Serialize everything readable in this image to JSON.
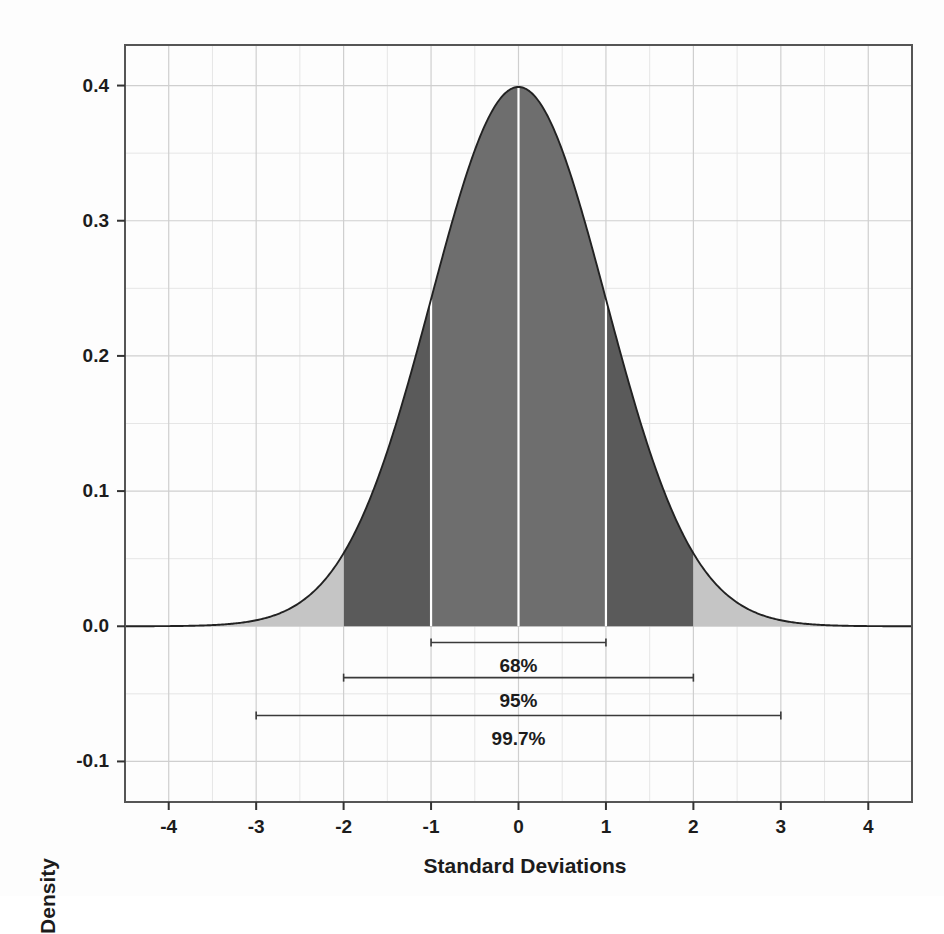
{
  "chart_data": {
    "type": "area",
    "title": "",
    "xlabel": "Standard Deviations",
    "ylabel": "Density",
    "xlim": [
      -4.5,
      4.5
    ],
    "ylim": [
      -0.13,
      0.43
    ],
    "grid": true,
    "legend_position": "none",
    "x_ticks": [
      "-4",
      "-3",
      "-2",
      "-1",
      "0",
      "1",
      "2",
      "3",
      "4"
    ],
    "x_tick_values": [
      -4,
      -3,
      -2,
      -1,
      0,
      1,
      2,
      3,
      4
    ],
    "y_ticks": [
      "0.4",
      "0.3",
      "0.2",
      "0.1",
      "0.0",
      "-0.1"
    ],
    "y_tick_values": [
      0.4,
      0.3,
      0.2,
      0.1,
      0.0,
      -0.1
    ],
    "distribution": "standard normal",
    "peak_value": 0.399,
    "peak_x": 0,
    "series": [
      {
        "name": "Standard normal density",
        "x": [
          -4.5,
          -4.25,
          -4,
          -3.75,
          -3.5,
          -3.25,
          -3,
          -2.75,
          -2.5,
          -2.25,
          -2,
          -1.75,
          -1.5,
          -1.25,
          -1,
          -0.75,
          -0.5,
          -0.25,
          0,
          0.25,
          0.5,
          0.75,
          1,
          1.25,
          1.5,
          1.75,
          2,
          2.25,
          2.5,
          2.75,
          3,
          3.25,
          3.5,
          3.75,
          4,
          4.25,
          4.5
        ],
        "values": [
          0.0,
          0.0001,
          0.0001,
          0.0004,
          0.0009,
          0.002,
          0.0044,
          0.0091,
          0.0175,
          0.0317,
          0.054,
          0.0863,
          0.1295,
          0.1826,
          0.242,
          0.3011,
          0.3521,
          0.3867,
          0.3989,
          0.3867,
          0.3521,
          0.3011,
          0.242,
          0.1826,
          0.1295,
          0.0863,
          0.054,
          0.0317,
          0.0175,
          0.0091,
          0.0044,
          0.002,
          0.0009,
          0.0004,
          0.0001,
          0.0001,
          0.0
        ]
      }
    ],
    "shaded_regions": [
      {
        "name": "within-1-sd",
        "from": -1,
        "to": 1,
        "color": "#6e6e6e",
        "label": "68%"
      },
      {
        "name": "one-to-two-sd-left",
        "from": -2,
        "to": -1,
        "color": "#5a5a5a",
        "label": "95%"
      },
      {
        "name": "one-to-two-sd-right",
        "from": 1,
        "to": 2,
        "color": "#5a5a5a",
        "label": "95%"
      },
      {
        "name": "beyond-two-sd-left",
        "from": -4.5,
        "to": -2,
        "color": "#c5c5c5",
        "label": "99.7%"
      },
      {
        "name": "beyond-two-sd-right",
        "from": 2,
        "to": 4.5,
        "color": "#c5c5c5",
        "label": "99.7%"
      }
    ],
    "annotations": [
      {
        "name": "bracket-68",
        "label": "68%",
        "from": -1,
        "to": 1,
        "y": -0.012,
        "label_y": -0.03
      },
      {
        "name": "bracket-95",
        "label": "95%",
        "from": -2,
        "to": 2,
        "y": -0.038,
        "label_y": -0.056
      },
      {
        "name": "bracket-997",
        "label": "99.7%",
        "from": -3,
        "to": 3,
        "y": -0.066,
        "label_y": -0.084
      }
    ],
    "separator_lines_x": [
      -1,
      0,
      1
    ],
    "colors": {
      "fill_inner": "#6e6e6e",
      "fill_mid": "#5a5a5a",
      "fill_outer": "#c5c5c5",
      "curve_stroke": "#222222",
      "grid_major": "#cfcfcf",
      "grid_minor": "#e6e6e6",
      "frame": "#555555",
      "separator": "#ffffff",
      "text": "#1c1c1c",
      "background": "#fdfdfd"
    }
  }
}
